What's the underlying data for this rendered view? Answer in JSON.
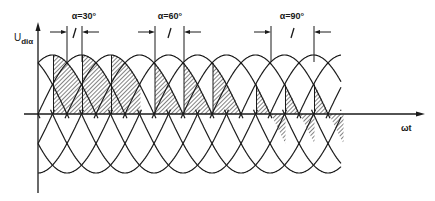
{
  "figure": {
    "y_axis_label": {
      "main": "U",
      "sub": "diα"
    },
    "x_axis_label": "ωt",
    "colors": {
      "ink": "#1a1a1a",
      "background": "#ffffff"
    }
  },
  "geometry": {
    "zero_y": 114,
    "amplitude": 59,
    "axis_x": 38,
    "period_px": 174,
    "first_peak_x": 52.5,
    "curve_start_x": 38,
    "curve_end_x": 341,
    "x_axis_start": 24,
    "x_axis_end": 425,
    "y_axis_top": 22,
    "y_axis_bottom": 193
  },
  "annotations": [
    {
      "label": "α=30°",
      "alpha_deg": 30,
      "label_x": 84,
      "firing_x": [
        53.5,
        82.5,
        111.5
      ],
      "marker_left_x": 67,
      "marker_right_x": 82
    },
    {
      "label": "α=60°",
      "alpha_deg": 60,
      "label_x": 170,
      "firing_x": [
        155,
        184,
        213
      ],
      "marker_left_x": 155,
      "marker_right_x": 184
    },
    {
      "label": "α=90°",
      "alpha_deg": 90,
      "label_x": 292,
      "firing_x": [
        256.5,
        285.5,
        314.5
      ],
      "marker_left_x": 271,
      "marker_right_x": 314
    }
  ]
}
